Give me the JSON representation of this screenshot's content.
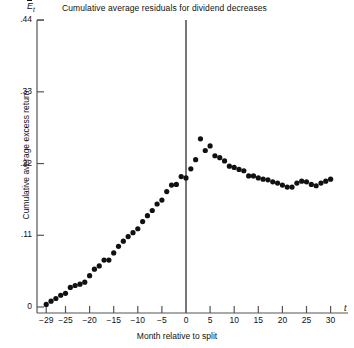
{
  "figure": {
    "title": "Cumulative average residuals for dividend decreases",
    "y_axis_symbol_main": "E",
    "y_axis_symbol_sub": "t",
    "x_axis_symbol": "t",
    "x_axis_title": "Month relative to split",
    "y_axis_title": "Cumulative average excess return",
    "marker_color": "#111111",
    "axis_color": "#555555",
    "background": "#ffffff"
  },
  "chart_data": {
    "type": "scatter",
    "title": "Cumulative average residuals for dividend decreases",
    "xlabel": "Month relative to split",
    "ylabel": "Cumulative average excess return",
    "xlim": [
      -30,
      32
    ],
    "ylim": [
      0,
      0.44
    ],
    "grid": false,
    "legend": null,
    "x_ticks": [
      -29,
      -25,
      -20,
      -15,
      -10,
      -5,
      0,
      5,
      10,
      15,
      20,
      25,
      30
    ],
    "x_tick_labels": [
      "−29",
      "−25",
      "−20",
      "−15",
      "−10",
      "−5",
      "0",
      "5",
      "10",
      "15",
      "20",
      "25",
      "30"
    ],
    "y_ticks": [
      0,
      0.11,
      0.22,
      0.33,
      0.44
    ],
    "y_tick_labels": [
      "0",
      ".11",
      ".22",
      ".33",
      ".44"
    ],
    "vertical_rule_x": 0,
    "x": [
      -29,
      -28,
      -27,
      -26,
      -25,
      -24,
      -23,
      -22,
      -21,
      -20,
      -19,
      -18,
      -17,
      -16,
      -15,
      -14,
      -13,
      -12,
      -11,
      -10,
      -9,
      -8,
      -7,
      -6,
      -5,
      -4,
      -3,
      -2,
      -1,
      0,
      1,
      2,
      3,
      4,
      5,
      6,
      7,
      8,
      9,
      10,
      11,
      12,
      13,
      14,
      15,
      16,
      17,
      18,
      19,
      20,
      21,
      22,
      23,
      24,
      25,
      26,
      27,
      28,
      29,
      30
    ],
    "y": [
      0.004,
      0.009,
      0.013,
      0.018,
      0.021,
      0.03,
      0.033,
      0.035,
      0.038,
      0.048,
      0.058,
      0.063,
      0.072,
      0.072,
      0.083,
      0.093,
      0.101,
      0.108,
      0.114,
      0.12,
      0.131,
      0.14,
      0.148,
      0.158,
      0.164,
      0.177,
      0.187,
      0.188,
      0.2,
      0.198,
      0.212,
      0.226,
      0.258,
      0.24,
      0.247,
      0.232,
      0.229,
      0.224,
      0.216,
      0.214,
      0.211,
      0.209,
      0.201,
      0.201,
      0.198,
      0.196,
      0.195,
      0.192,
      0.19,
      0.187,
      0.184,
      0.184,
      0.19,
      0.193,
      0.192,
      0.188,
      0.186,
      0.19,
      0.193,
      0.196
    ],
    "series_note": "single series of cumulative average excess returns, monthly, plotted as filled round markers"
  }
}
